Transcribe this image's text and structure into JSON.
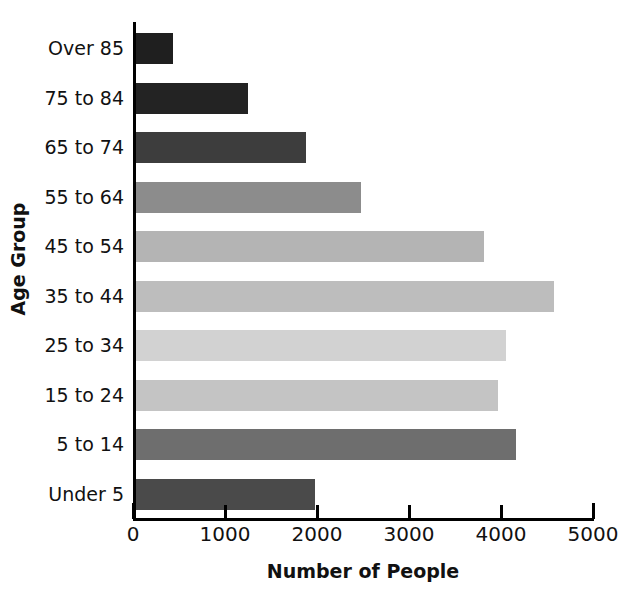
{
  "chart_data": {
    "type": "bar",
    "orientation": "horizontal",
    "title": "",
    "xlabel": "Number of People",
    "ylabel": "Age Group",
    "categories": [
      "Over 85",
      "75 to 84",
      "65 to 74",
      "55 to 64",
      "45 to 54",
      "35 to 44",
      "25 to 34",
      "15 to 24",
      "5 to 14",
      "Under 5"
    ],
    "values": [
      400,
      1220,
      1850,
      2450,
      3780,
      4540,
      4020,
      3930,
      4130,
      1950
    ],
    "bar_colors": [
      "#1f1f1f",
      "#232323",
      "#3d3d3d",
      "#8c8c8c",
      "#b4b4b4",
      "#bdbdbd",
      "#d2d2d2",
      "#c4c4c4",
      "#6e6e6e",
      "#4a4a4a"
    ],
    "xlim": [
      0,
      5000
    ],
    "xticks": [
      0,
      1000,
      2000,
      3000,
      4000,
      5000
    ],
    "xtick_labels": [
      "0",
      "1000",
      "2000",
      "3000",
      "4000",
      "5000"
    ],
    "grid": false,
    "legend": false,
    "axis_color": "#000000",
    "background_color": "#ffffff"
  }
}
